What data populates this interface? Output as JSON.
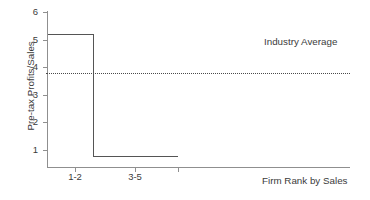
{
  "chart_data": {
    "type": "line",
    "title": "",
    "subtitle": "",
    "xlabel": "Firm Rank by Sales",
    "ylabel": "Pre-tax Profits/Sales",
    "xlim": [
      0,
      11
    ],
    "ylim": [
      0,
      6.4
    ],
    "grid": false,
    "legend_position": "none",
    "y_ticks": [
      {
        "value": 6,
        "label": "6",
        "px_top": 12
      },
      {
        "value": 5,
        "label": "5",
        "px_top": 39.6
      },
      {
        "value": 4,
        "label": "4",
        "px_top": 67.2
      },
      {
        "value": 3,
        "label": "3",
        "px_top": 94.8
      },
      {
        "value": 2,
        "label": "2",
        "px_top": 122.4
      },
      {
        "value": 1,
        "label": "1",
        "px_top": 150
      }
    ],
    "x_ticks": [
      {
        "label": "1-2",
        "px_left": 75
      },
      {
        "label": "3-5",
        "px_left": 135
      },
      {
        "label": "",
        "px_left": 178
      }
    ],
    "series": [
      {
        "name": "Pre-tax Profits/Sales by firm rank",
        "type": "step",
        "color": "#555555",
        "points": [
          {
            "x_px": 48,
            "y_value": 5.2,
            "y_px": 34
          },
          {
            "x_px": 93,
            "y_value": 5.2,
            "y_px": 34
          },
          {
            "x_px": 93,
            "y_value": 0.7,
            "y_px": 156
          },
          {
            "x_px": 178,
            "y_value": 0.7,
            "y_px": 156
          }
        ]
      },
      {
        "name": "Industry Average",
        "type": "reference-line",
        "style": "dotted",
        "color": "#4a4a4a",
        "y_value": 3.75,
        "y_px": 73,
        "x_start_px": 46,
        "x_end_px": 350
      }
    ],
    "annotations": [
      {
        "text": "Industry Average",
        "x_px": 264,
        "y_px": 37
      }
    ]
  },
  "axes": {
    "y_axis_title": "Pre-tax Profits/Sales",
    "x_axis_title": "Firm Rank by Sales"
  },
  "annotations": {
    "industry_average": "Industry Average"
  }
}
